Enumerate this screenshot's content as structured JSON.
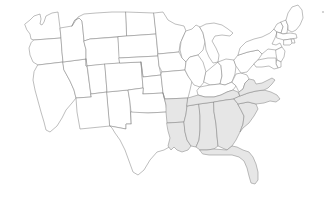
{
  "map": {
    "title": "United States map",
    "region_label": "Southeastern United States",
    "projection": "albers-usa-approx",
    "background_color": "#ffffff",
    "border_color": "#888888",
    "default_fill": "#ffffff",
    "highlight_fill": "#e6e6e6",
    "units": "states",
    "total_states_drawn": 49,
    "highlighted_count": 10,
    "highlighted_states": [
      "Arkansas",
      "Louisiana",
      "Mississippi",
      "Alabama",
      "Tennessee",
      "Georgia",
      "Florida",
      "South Carolina",
      "North Carolina",
      "Virginia"
    ],
    "unhighlighted_states": [
      "Washington",
      "Oregon",
      "California",
      "Nevada",
      "Idaho",
      "Montana",
      "Wyoming",
      "Utah",
      "Arizona",
      "New Mexico",
      "Colorado",
      "North Dakota",
      "South Dakota",
      "Nebraska",
      "Kansas",
      "Oklahoma",
      "Texas",
      "Minnesota",
      "Iowa",
      "Missouri",
      "Wisconsin",
      "Illinois",
      "Michigan",
      "Indiana",
      "Ohio",
      "Kentucky",
      "West Virginia",
      "Pennsylvania",
      "New York",
      "Vermont",
      "New Hampshire",
      "Maine",
      "Massachusetts",
      "Rhode Island",
      "Connecticut",
      "New Jersey",
      "Delaware",
      "Maryland"
    ]
  },
  "states": {
    "WA": {
      "name": "Washington",
      "abbr": "WA",
      "highlighted": false
    },
    "OR": {
      "name": "Oregon",
      "abbr": "OR",
      "highlighted": false
    },
    "CA": {
      "name": "California",
      "abbr": "CA",
      "highlighted": false
    },
    "NV": {
      "name": "Nevada",
      "abbr": "NV",
      "highlighted": false
    },
    "ID": {
      "name": "Idaho",
      "abbr": "ID",
      "highlighted": false
    },
    "MT": {
      "name": "Montana",
      "abbr": "MT",
      "highlighted": false
    },
    "WY": {
      "name": "Wyoming",
      "abbr": "WY",
      "highlighted": false
    },
    "UT": {
      "name": "Utah",
      "abbr": "UT",
      "highlighted": false
    },
    "AZ": {
      "name": "Arizona",
      "abbr": "AZ",
      "highlighted": false
    },
    "NM": {
      "name": "New Mexico",
      "abbr": "NM",
      "highlighted": false
    },
    "CO": {
      "name": "Colorado",
      "abbr": "CO",
      "highlighted": false
    },
    "ND": {
      "name": "North Dakota",
      "abbr": "ND",
      "highlighted": false
    },
    "SD": {
      "name": "South Dakota",
      "abbr": "SD",
      "highlighted": false
    },
    "NE": {
      "name": "Nebraska",
      "abbr": "NE",
      "highlighted": false
    },
    "KS": {
      "name": "Kansas",
      "abbr": "KS",
      "highlighted": false
    },
    "OK": {
      "name": "Oklahoma",
      "abbr": "OK",
      "highlighted": false
    },
    "TX": {
      "name": "Texas",
      "abbr": "TX",
      "highlighted": false
    },
    "MN": {
      "name": "Minnesota",
      "abbr": "MN",
      "highlighted": false
    },
    "IA": {
      "name": "Iowa",
      "abbr": "IA",
      "highlighted": false
    },
    "MO": {
      "name": "Missouri",
      "abbr": "MO",
      "highlighted": false
    },
    "WI": {
      "name": "Wisconsin",
      "abbr": "WI",
      "highlighted": false
    },
    "IL": {
      "name": "Illinois",
      "abbr": "IL",
      "highlighted": false
    },
    "MI": {
      "name": "Michigan",
      "abbr": "MI",
      "highlighted": false
    },
    "IN": {
      "name": "Indiana",
      "abbr": "IN",
      "highlighted": false
    },
    "OH": {
      "name": "Ohio",
      "abbr": "OH",
      "highlighted": false
    },
    "KY": {
      "name": "Kentucky",
      "abbr": "KY",
      "highlighted": false
    },
    "WV": {
      "name": "West Virginia",
      "abbr": "WV",
      "highlighted": false
    },
    "PA": {
      "name": "Pennsylvania",
      "abbr": "PA",
      "highlighted": false
    },
    "NY": {
      "name": "New York",
      "abbr": "NY",
      "highlighted": false
    },
    "VT": {
      "name": "Vermont",
      "abbr": "VT",
      "highlighted": false
    },
    "NH": {
      "name": "New Hampshire",
      "abbr": "NH",
      "highlighted": false
    },
    "ME": {
      "name": "Maine",
      "abbr": "ME",
      "highlighted": false
    },
    "MA": {
      "name": "Massachusetts",
      "abbr": "MA",
      "highlighted": false
    },
    "RI": {
      "name": "Rhode Island",
      "abbr": "RI",
      "highlighted": false
    },
    "CT": {
      "name": "Connecticut",
      "abbr": "CT",
      "highlighted": false
    },
    "NJ": {
      "name": "New Jersey",
      "abbr": "NJ",
      "highlighted": false
    },
    "DE": {
      "name": "Delaware",
      "abbr": "DE",
      "highlighted": false
    },
    "MD": {
      "name": "Maryland",
      "abbr": "MD",
      "highlighted": false
    },
    "AR": {
      "name": "Arkansas",
      "abbr": "AR",
      "highlighted": true
    },
    "LA": {
      "name": "Louisiana",
      "abbr": "LA",
      "highlighted": true
    },
    "MS": {
      "name": "Mississippi",
      "abbr": "MS",
      "highlighted": true
    },
    "AL": {
      "name": "Alabama",
      "abbr": "AL",
      "highlighted": true
    },
    "TN": {
      "name": "Tennessee",
      "abbr": "TN",
      "highlighted": true
    },
    "GA": {
      "name": "Georgia",
      "abbr": "GA",
      "highlighted": true
    },
    "FL": {
      "name": "Florida",
      "abbr": "FL",
      "highlighted": true
    },
    "SC": {
      "name": "South Carolina",
      "abbr": "SC",
      "highlighted": true
    },
    "NC": {
      "name": "North Carolina",
      "abbr": "NC",
      "highlighted": true
    },
    "VA": {
      "name": "Virginia",
      "abbr": "VA",
      "highlighted": true
    }
  }
}
